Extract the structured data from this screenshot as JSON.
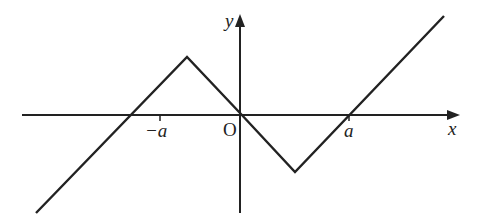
{
  "diagram": {
    "type": "function-graph",
    "axes": {
      "x_label": "x",
      "y_label": "y",
      "origin_label": "O"
    },
    "ticks": {
      "neg_a_label": "−a",
      "pos_a_label": "a"
    },
    "colors": {
      "line": "#222222",
      "background": "#ffffff"
    },
    "graph_points": [
      {
        "x": "-∞",
        "y": "-∞"
      },
      {
        "x": "-a/2",
        "y": "max"
      },
      {
        "x": 0,
        "y": 0
      },
      {
        "x": "a/2",
        "y": "min"
      },
      {
        "x": "+∞",
        "y": "+∞"
      }
    ],
    "zeros": [
      "−a",
      "0",
      "a"
    ]
  }
}
